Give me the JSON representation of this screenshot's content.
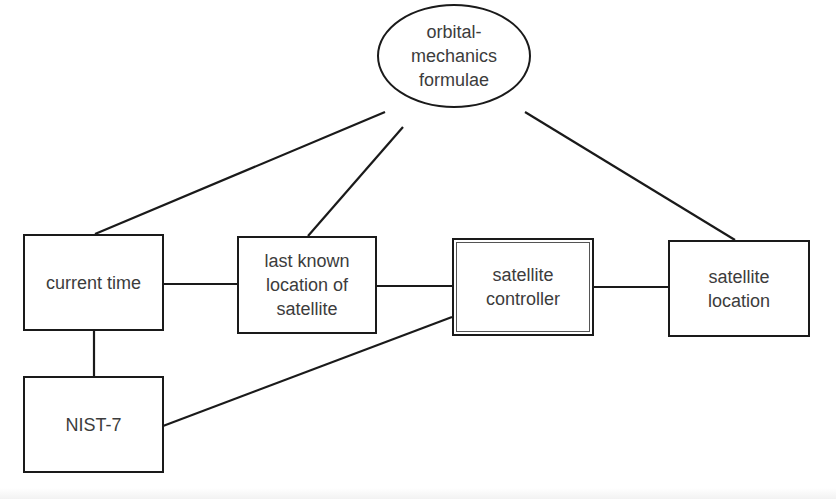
{
  "diagram": {
    "type": "entity-relationship",
    "nodes": [
      {
        "id": "orbital",
        "shape": "ellipse",
        "label": "orbital-\nmechanics\nformulae"
      },
      {
        "id": "current_time",
        "shape": "rectangle",
        "label": "current time"
      },
      {
        "id": "last_known",
        "shape": "rectangle",
        "label": "last known\nlocation of\nsatellite"
      },
      {
        "id": "controller",
        "shape": "double-rectangle",
        "label": "satellite\ncontroller"
      },
      {
        "id": "sat_location",
        "shape": "rectangle",
        "label": "satellite\nlocation"
      },
      {
        "id": "nist",
        "shape": "rectangle",
        "label": "NIST-7"
      }
    ],
    "edges": [
      {
        "from": "orbital",
        "to": "current_time"
      },
      {
        "from": "orbital",
        "to": "last_known"
      },
      {
        "from": "orbital",
        "to": "sat_location"
      },
      {
        "from": "current_time",
        "to": "last_known"
      },
      {
        "from": "last_known",
        "to": "controller"
      },
      {
        "from": "controller",
        "to": "sat_location"
      },
      {
        "from": "current_time",
        "to": "nist"
      },
      {
        "from": "nist",
        "to": "controller"
      }
    ],
    "colors": {
      "stroke": "#1a1a1a",
      "text": "#3c3c3c",
      "background": "#ffffff"
    }
  }
}
